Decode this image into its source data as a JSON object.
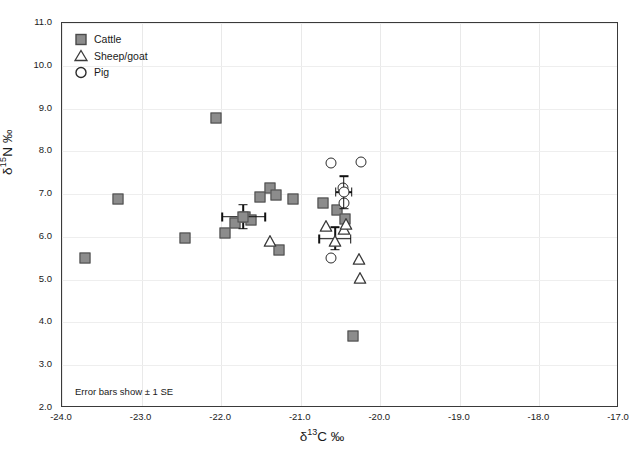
{
  "chart_data": {
    "type": "scatter",
    "title": "",
    "xlabel": "δ¹³C ‰",
    "ylabel": "δ¹⁵N ‰",
    "xlim": [
      -24.0,
      -17.0
    ],
    "ylim": [
      2.0,
      11.0
    ],
    "xticks": [
      "-24.0",
      "-23.0",
      "-22.0",
      "-21.0",
      "-20.0",
      "-19.0",
      "-18.0",
      "-17.0"
    ],
    "yticks": [
      "11.0",
      "10.0",
      "9.0",
      "8.0",
      "7.0",
      "6.0",
      "5.0",
      "4.0",
      "3.0",
      "2.0"
    ],
    "grid": true,
    "legend_position": "top-left",
    "annotation": "Error bars show ± 1 SE",
    "series": [
      {
        "name": "Cattle",
        "marker": "filled-square",
        "color": "#8c8c8c",
        "edge_color": "#4a4a4a",
        "points": [
          {
            "x": -23.71,
            "y": 5.5
          },
          {
            "x": -23.29,
            "y": 6.89
          },
          {
            "x": -22.45,
            "y": 5.98
          },
          {
            "x": -22.07,
            "y": 8.78
          },
          {
            "x": -21.95,
            "y": 6.1
          },
          {
            "x": -21.83,
            "y": 6.33
          },
          {
            "x": -21.7,
            "y": 6.46
          },
          {
            "x": -21.62,
            "y": 6.39
          },
          {
            "x": -21.51,
            "y": 6.94
          },
          {
            "x": -21.38,
            "y": 7.15
          },
          {
            "x": -21.31,
            "y": 6.98
          },
          {
            "x": -21.27,
            "y": 5.7
          },
          {
            "x": -21.1,
            "y": 6.89
          },
          {
            "x": -20.72,
            "y": 6.79
          },
          {
            "x": -20.55,
            "y": 6.62
          },
          {
            "x": -20.44,
            "y": 6.42
          },
          {
            "x": -20.34,
            "y": 3.68
          }
        ]
      },
      {
        "name": "Sheep/goat",
        "marker": "open-triangle",
        "color": "#ffffff",
        "edge_color": "#3a3a3a",
        "points": [
          {
            "x": -21.38,
            "y": 5.94
          },
          {
            "x": -20.68,
            "y": 6.3
          },
          {
            "x": -20.45,
            "y": 6.24
          },
          {
            "x": -20.43,
            "y": 6.34
          },
          {
            "x": -20.27,
            "y": 5.53
          },
          {
            "x": -20.26,
            "y": 5.08
          }
        ]
      },
      {
        "name": "Pig",
        "marker": "open-circle",
        "color": "#ffffff",
        "edge_color": "#2b2b2b",
        "points": [
          {
            "x": -20.62,
            "y": 7.72
          },
          {
            "x": -20.24,
            "y": 7.74
          },
          {
            "x": -20.47,
            "y": 7.14
          },
          {
            "x": -20.45,
            "y": 6.79
          },
          {
            "x": -20.62,
            "y": 5.5
          }
        ]
      }
    ],
    "means": [
      {
        "series": "Cattle",
        "marker": "filled-square",
        "x": -21.72,
        "y": 6.47,
        "x_err": 0.27,
        "y_err": 0.28
      },
      {
        "series": "Pig",
        "marker": "open-circle",
        "x": -20.46,
        "y": 7.04,
        "x_err": 0.1,
        "y_err": 0.38
      },
      {
        "series": "Sheep/goat",
        "marker": "open-triangle",
        "x": -20.57,
        "y": 5.96,
        "x_err": 0.2,
        "y_err": 0.26
      }
    ]
  },
  "legend": {
    "items": [
      {
        "label": "Cattle",
        "marker": "filled-square"
      },
      {
        "label": "Sheep/goat",
        "marker": "open-triangle"
      },
      {
        "label": "Pig",
        "marker": "open-circle"
      }
    ]
  },
  "caption": ""
}
